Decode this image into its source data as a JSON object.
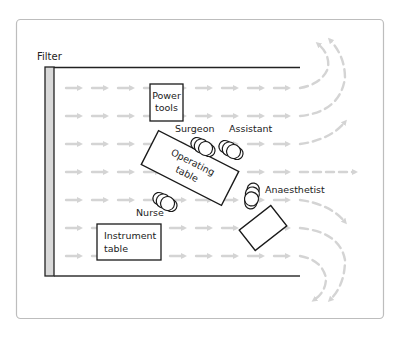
{
  "diagram": {
    "labels": {
      "filter": "Filter",
      "power_tools": [
        "Power",
        "tools"
      ],
      "surgeon": "Surgeon",
      "assistant": "Assistant",
      "operating_table": [
        "Operating",
        "table"
      ],
      "anaesthetist": "Anaesthetist",
      "nurse": "Nurse",
      "instrument_table": [
        "Instrument",
        "table"
      ]
    },
    "colors": {
      "frame": "#b8b8b8",
      "wall": "#222222",
      "filter_fill": "#d9d9d9",
      "arrow": "#d4d4d4",
      "outline": "#1a1a1a"
    },
    "airflow": {
      "direction": "left-to-right",
      "rows": 7
    }
  }
}
